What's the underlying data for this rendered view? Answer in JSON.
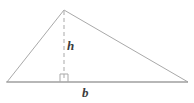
{
  "figure": {
    "type": "geometry-diagram",
    "canvas": {
      "width": 194,
      "height": 103,
      "background": "#ffffff"
    },
    "stroke": {
      "color": "#a9a9a9",
      "dark_color": "#9a9a9a",
      "width": 1
    },
    "label_color": "#3c3c3c",
    "triangle": {
      "name": "triangle-outline",
      "apex": {
        "x": 64,
        "y": 10
      },
      "left_vertex": {
        "x": 7,
        "y": 82
      },
      "right_vertex": {
        "x": 188,
        "y": 82
      },
      "points": "64,10 7,82 188,82"
    },
    "base_line": {
      "name": "base-line",
      "x1": 6,
      "y1": 82,
      "x2": 188,
      "y2": 82
    },
    "height_line": {
      "name": "height-dashed-line",
      "x1": 64,
      "y1": 11,
      "x2": 64,
      "y2": 81,
      "dash": "4 3"
    },
    "right_angle_marker": {
      "name": "right-angle-marker",
      "x": 60,
      "y": 74,
      "size": 8,
      "path": "M 60 82 L 60 74 L 68 74 L 68 82"
    },
    "labels": {
      "height": "h",
      "base": "b"
    }
  }
}
